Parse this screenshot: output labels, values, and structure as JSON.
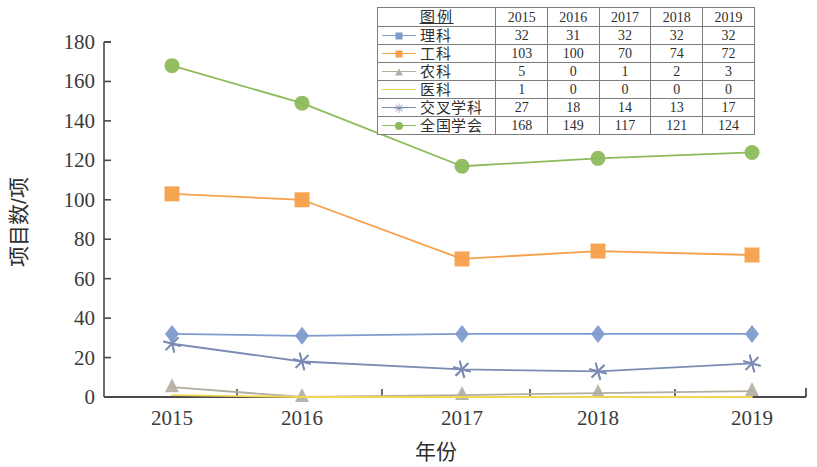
{
  "chart_data": {
    "type": "line",
    "title": "",
    "xlabel": "年份",
    "ylabel": "项目数/项",
    "categories": [
      "2015",
      "2016",
      "2017",
      "2018",
      "2019"
    ],
    "x": [
      2015,
      2016,
      2017,
      2018,
      2019
    ],
    "ylim": [
      0,
      180
    ],
    "yticks": [
      0,
      20,
      40,
      60,
      80,
      100,
      120,
      140,
      160,
      180
    ],
    "grid": false,
    "legend_position": "top-center-table",
    "series": [
      {
        "name": "理科",
        "values": [
          32,
          31,
          32,
          32,
          32
        ],
        "color": "#7e9ccc",
        "marker": "diamond"
      },
      {
        "name": "工科",
        "values": [
          103,
          100,
          70,
          74,
          72
        ],
        "color": "#f5a04b",
        "marker": "square"
      },
      {
        "name": "农科",
        "values": [
          5,
          0,
          1,
          2,
          3
        ],
        "color": "#b3ada0",
        "marker": "triangle"
      },
      {
        "name": "医科",
        "values": [
          1,
          0,
          0,
          0,
          0
        ],
        "color": "#f2d653",
        "marker": "none"
      },
      {
        "name": "交叉学科",
        "values": [
          27,
          18,
          14,
          13,
          17
        ],
        "color": "#7b8cb4",
        "marker": "asterisk"
      },
      {
        "name": "全国学会",
        "values": [
          168,
          149,
          117,
          121,
          124
        ],
        "color": "#8dbb5c",
        "marker": "circle"
      }
    ]
  },
  "legend_table": {
    "header": [
      "图例",
      "2015",
      "2016",
      "2017",
      "2018",
      "2019"
    ],
    "rows": [
      {
        "name": "理科",
        "values": [
          "32",
          "31",
          "32",
          "32",
          "32"
        ]
      },
      {
        "name": "工科",
        "values": [
          "103",
          "100",
          "70",
          "74",
          "72"
        ]
      },
      {
        "name": "农科",
        "values": [
          "5",
          "0",
          "1",
          "2",
          "3"
        ]
      },
      {
        "name": "医科",
        "values": [
          "1",
          "0",
          "0",
          "0",
          "0"
        ]
      },
      {
        "name": "交叉学科",
        "values": [
          "27",
          "18",
          "14",
          "13",
          "17"
        ]
      },
      {
        "name": "全国学会",
        "values": [
          "168",
          "149",
          "117",
          "121",
          "124"
        ]
      }
    ]
  },
  "axes": {
    "y_tick_labels": [
      "180",
      "160",
      "140",
      "120",
      "100",
      "80",
      "60",
      "40",
      "20",
      "0"
    ],
    "x_tick_labels": [
      "2015",
      "2016",
      "2017",
      "2018",
      "2019"
    ],
    "y_axis_title": "项目数/项",
    "x_axis_title": "年份"
  },
  "colors": {
    "axis": "#4a4a4a",
    "like": "#7e9ccc",
    "gongke": "#f5a04b",
    "nongke": "#b3ada0",
    "yike": "#f2d653",
    "jiaocha": "#7b8cb4",
    "xuehui": "#8dbb5c"
  }
}
